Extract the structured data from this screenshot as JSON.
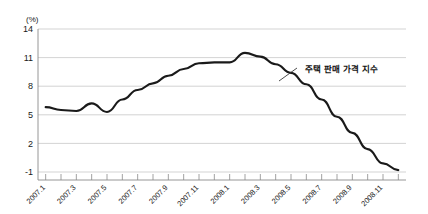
{
  "chart_data": {
    "type": "line",
    "title": "",
    "xlabel": "",
    "ylabel": "(%)",
    "ylim": [
      -1,
      14
    ],
    "yticks": [
      -1,
      2,
      5,
      8,
      11,
      14
    ],
    "ytick_labels": [
      "-1",
      "2",
      "5",
      "8",
      "11",
      "14"
    ],
    "grid": true,
    "legend_position": "none",
    "x": [
      "2007.1",
      "2007.2",
      "2007.3",
      "2007.4",
      "2007.5",
      "2007.6",
      "2007.7",
      "2007.8",
      "2007.9",
      "2007.10",
      "2007.11",
      "2007.12",
      "2008.1",
      "2008.2",
      "2008.3",
      "2008.4",
      "2008.5",
      "2008.6",
      "2008.7",
      "2008.8",
      "2008.9",
      "2008.10",
      "2008.11",
      "2008.12"
    ],
    "xtick_labels": [
      "2007.1",
      "2007.3",
      "2007.5",
      "2007.7",
      "2007.9",
      "2007.11",
      "2008.1",
      "2008.3",
      "2008.5",
      "2008.7",
      "2008.9",
      "2008.11"
    ],
    "xtick_label_indices": [
      0,
      2,
      4,
      6,
      8,
      10,
      12,
      14,
      16,
      18,
      20,
      22
    ],
    "series": [
      {
        "name": "주택 판매 가격 지수",
        "color": "#1a1a1a",
        "values": [
          5.8,
          5.5,
          5.4,
          6.2,
          5.3,
          6.6,
          7.6,
          8.3,
          9.1,
          9.8,
          10.4,
          10.5,
          10.5,
          11.5,
          11.1,
          10.3,
          9.4,
          8.2,
          6.6,
          4.8,
          3.1,
          1.4,
          -0.1,
          -0.8
        ]
      }
    ],
    "annotations": [
      {
        "text": "주택 판매 가격 지수",
        "x": 305,
        "y": 72
      }
    ]
  },
  "axis": {
    "unit_label": "(%)"
  }
}
